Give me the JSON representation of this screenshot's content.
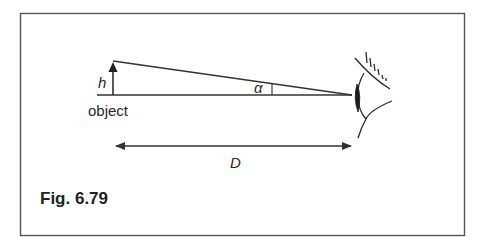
{
  "figure": {
    "caption": "Fig. 6.79",
    "labels": {
      "height": "h",
      "object": "object",
      "angle": "α",
      "distance": "D"
    },
    "elements": [
      "frame",
      "object-arrow",
      "baseline",
      "sight-line",
      "angle-marker",
      "eye",
      "distance-arrow"
    ],
    "colors": {
      "line": "#333333",
      "frame": "#555555",
      "text": "#2a2a2a",
      "background": "#ffffff"
    }
  }
}
